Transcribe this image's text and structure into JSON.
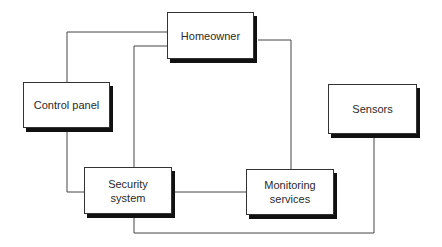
{
  "diagram": {
    "type": "block-diagram",
    "nodes": [
      {
        "id": "homeowner",
        "label": "Homeowner"
      },
      {
        "id": "control_panel",
        "label": "Control panel"
      },
      {
        "id": "sensors",
        "label": "Sensors"
      },
      {
        "id": "security_system",
        "label": "Security\nsystem"
      },
      {
        "id": "monitoring_services",
        "label": "Monitoring\nservices"
      }
    ],
    "edges": [
      {
        "from": "homeowner",
        "to": "control_panel"
      },
      {
        "from": "homeowner",
        "to": "security_system"
      },
      {
        "from": "homeowner",
        "to": "monitoring_services"
      },
      {
        "from": "control_panel",
        "to": "security_system"
      },
      {
        "from": "security_system",
        "to": "monitoring_services"
      },
      {
        "from": "security_system",
        "to": "sensors"
      }
    ],
    "colors": {
      "line": "#333333",
      "shadow": "#111111",
      "box_fill": "#ffffff",
      "text": "#2a2a2a"
    }
  }
}
